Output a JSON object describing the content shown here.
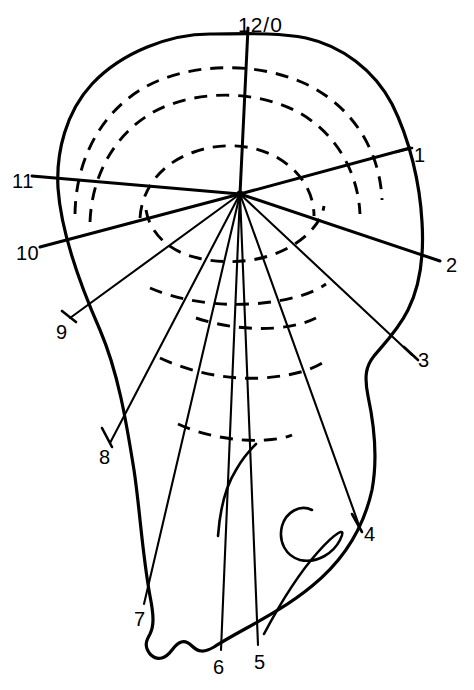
{
  "figure": {
    "type": "clock-face orientation diagram",
    "title": "",
    "caption": "",
    "hub": {
      "x": 240,
      "y": 194
    },
    "stroke_color": "#000000",
    "background_color": "#ffffff"
  },
  "clock_labels": [
    {
      "id": "12-0",
      "text": "12/0",
      "x": 238,
      "y": 14,
      "ray_angle_deg": 0
    },
    {
      "id": "1",
      "text": "1",
      "x": 414,
      "y": 145,
      "ray_angle_deg": 30
    },
    {
      "id": "2",
      "text": "2",
      "x": 446,
      "y": 255,
      "ray_angle_deg": 60
    },
    {
      "id": "3",
      "text": "3",
      "x": 418,
      "y": 350,
      "ray_angle_deg": 90
    },
    {
      "id": "4",
      "text": "4",
      "x": 364,
      "y": 524,
      "ray_angle_deg": 120
    },
    {
      "id": "5",
      "text": "5",
      "x": 254,
      "y": 652,
      "ray_angle_deg": 150
    },
    {
      "id": "6",
      "text": "6",
      "x": 213,
      "y": 657,
      "ray_angle_deg": 180
    },
    {
      "id": "7",
      "text": "7",
      "x": 134,
      "y": 609,
      "ray_angle_deg": 210
    },
    {
      "id": "8",
      "text": "8",
      "x": 99,
      "y": 447,
      "ray_angle_deg": 240
    },
    {
      "id": "9",
      "text": "9",
      "x": 56,
      "y": 322,
      "ray_angle_deg": 270
    },
    {
      "id": "10",
      "text": "10",
      "x": 16,
      "y": 243,
      "ray_angle_deg": 300
    },
    {
      "id": "11",
      "text": "11",
      "x": 12,
      "y": 171,
      "ray_angle_deg": 330
    }
  ],
  "rays": [
    {
      "id": "ray-12",
      "label": "12/0",
      "x1": 240,
      "y1": 194,
      "x2": 248,
      "y2": 28,
      "weight": "major"
    },
    {
      "id": "ray-1",
      "label": "1",
      "x1": 240,
      "y1": 194,
      "x2": 410,
      "y2": 148,
      "weight": "major"
    },
    {
      "id": "ray-2",
      "label": "2",
      "x1": 240,
      "y1": 194,
      "x2": 440,
      "y2": 261,
      "weight": "major"
    },
    {
      "id": "ray-3",
      "label": "3",
      "x1": 240,
      "y1": 194,
      "x2": 412,
      "y2": 355,
      "weight": "minor"
    },
    {
      "id": "ray-4",
      "label": "4",
      "x1": 240,
      "y1": 194,
      "x2": 360,
      "y2": 528,
      "weight": "minor"
    },
    {
      "id": "ray-5",
      "label": "5",
      "x1": 240,
      "y1": 194,
      "x2": 258,
      "y2": 645,
      "weight": "minor"
    },
    {
      "id": "ray-6",
      "label": "6",
      "x1": 240,
      "y1": 194,
      "x2": 221,
      "y2": 650,
      "weight": "minor"
    },
    {
      "id": "ray-7",
      "label": "7",
      "x1": 240,
      "y1": 194,
      "x2": 144,
      "y2": 604,
      "weight": "minor"
    },
    {
      "id": "ray-8",
      "label": "8",
      "x1": 240,
      "y1": 194,
      "x2": 110,
      "y2": 443,
      "weight": "minor"
    },
    {
      "id": "ray-9",
      "label": "9",
      "x1": 240,
      "y1": 194,
      "x2": 70,
      "y2": 318,
      "weight": "minor"
    },
    {
      "id": "ray-10",
      "label": "10",
      "x1": 240,
      "y1": 194,
      "x2": 40,
      "y2": 247,
      "weight": "major"
    },
    {
      "id": "ray-11",
      "label": "11",
      "x1": 240,
      "y1": 194,
      "x2": 32,
      "y2": 176,
      "weight": "major"
    }
  ],
  "contours": {
    "count": 8,
    "style": "dashed",
    "description": "concentric dashed iso-contour arcs centred on the hub"
  },
  "notes": {
    "outline_description": "solid irregular organ outline enclosing the clock face",
    "inner_hook_description": "solid hook-shaped curve in the lower-right lobe",
    "inner_tail_description": "short solid curve descending below the hub"
  }
}
